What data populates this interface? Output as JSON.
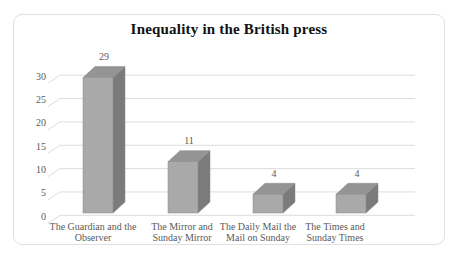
{
  "window": {
    "background": "#ffffff"
  },
  "chart": {
    "title": "Inequality in the British press"
  },
  "chart_data": {
    "type": "bar",
    "subtype": "3d-column",
    "title": "Inequality in the British press",
    "categories": [
      "The Guardian and the Observer",
      "The Mirror and Sunday Mirror",
      "The Daily Mail the Mail on Sunday",
      "The Times and Sunday Times"
    ],
    "category_lines": [
      [
        "The Guardian and the",
        "Observer"
      ],
      [
        "The Mirror and",
        "Sunday Mirror"
      ],
      [
        "The Daily Mail the",
        "Mail on Sunday"
      ],
      [
        "The Times and",
        "Sunday Times"
      ]
    ],
    "values": [
      29,
      11,
      4,
      4
    ],
    "data_labels": [
      "29",
      "11",
      "4",
      "4"
    ],
    "y_ticks": [
      0,
      5,
      10,
      15,
      20,
      25,
      30
    ],
    "ylim": [
      0,
      30
    ],
    "xlabel": "",
    "ylabel": "",
    "grid": true,
    "legend": "none",
    "colors": {
      "bar_front": "#a9a9a9",
      "bar_top": "#949494",
      "bar_side": "#7b7b7b",
      "bar_outline": "#8a8a8a",
      "gridline": "#dcdcdc",
      "axis_text": "#5a5a5a",
      "data_label_text": "#595959",
      "title_text": "#111111",
      "frame_border": "#e0e0e0",
      "background": "#ffffff"
    }
  }
}
